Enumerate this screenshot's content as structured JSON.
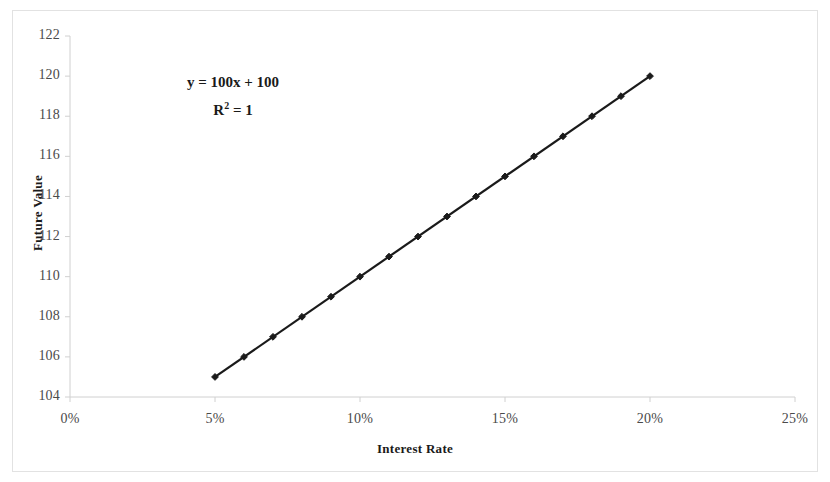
{
  "chart_data": {
    "type": "scatter",
    "title": "",
    "xlabel": "Interest Rate",
    "ylabel": "Future Value",
    "xlim": [
      0,
      25
    ],
    "ylim": [
      104,
      122
    ],
    "xticks": [
      "0%",
      "5%",
      "10%",
      "15%",
      "20%",
      "25%"
    ],
    "xtick_values": [
      0,
      5,
      10,
      15,
      20,
      25
    ],
    "yticks": [
      "104",
      "106",
      "108",
      "110",
      "112",
      "114",
      "116",
      "118",
      "120",
      "122"
    ],
    "ytick_values": [
      104,
      106,
      108,
      110,
      112,
      114,
      116,
      118,
      120,
      122
    ],
    "grid": false,
    "legend": false,
    "marker": "diamond",
    "series": [
      {
        "name": "Future Value",
        "x": [
          5,
          6,
          7,
          8,
          9,
          10,
          11,
          12,
          13,
          14,
          15,
          16,
          17,
          18,
          19,
          20
        ],
        "values": [
          105,
          106,
          107,
          108,
          109,
          110,
          111,
          112,
          113,
          114,
          115,
          116,
          117,
          118,
          119,
          120
        ],
        "color": "#1a1a1a"
      }
    ],
    "trendline": {
      "equation": "y = 100x + 100",
      "r_squared_label": "R",
      "r_squared_exponent": "2",
      "r_squared_value": "= 1",
      "color": "#1a1a1a"
    },
    "annotations": {
      "equation": "y = 100x + 100",
      "r_squared": "R² = 1"
    },
    "colors": {
      "axis": "#d0d0d0",
      "border": "#e2e2e2",
      "text": "#4a4a4a",
      "data": "#1a1a1a",
      "background": "#ffffff"
    }
  }
}
